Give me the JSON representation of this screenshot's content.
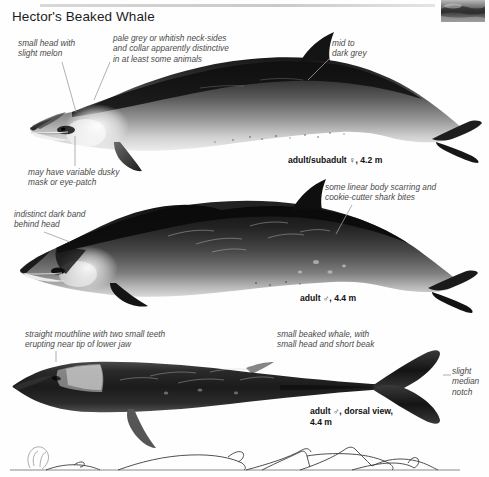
{
  "page": {
    "title": "Hector's Beaked Whale",
    "background_color": "#ffffff",
    "rule_color": "#d2d2d2"
  },
  "thumbnail": {
    "name": "beaked-whale-photo-thumbnail",
    "caption": ""
  },
  "annotations": [
    {
      "id": "small-head",
      "text": "small head with\nslight melon",
      "x": 18,
      "y": 38,
      "leader": {
        "x1": 60,
        "y1": 62,
        "x2": 75,
        "y2": 108
      }
    },
    {
      "id": "pale-grey-neck",
      "text": "pale grey or whitish neck-sides\nand collar apparently distinctive\nin at least some animals",
      "x": 113,
      "y": 33,
      "leader": {
        "x1": 108,
        "y1": 40,
        "x2": 93,
        "y2": 95
      }
    },
    {
      "id": "mid-to-dark-grey",
      "text": "mid to\ndark grey",
      "x": 332,
      "y": 38,
      "leader": {
        "x1": 330,
        "y1": 47,
        "x2": 305,
        "y2": 78
      }
    },
    {
      "id": "dusky-mask",
      "text": "may have variable dusky\nmask or eye-patch",
      "x": 28,
      "y": 167,
      "leader": {
        "x1": 74,
        "y1": 166,
        "x2": 74,
        "y2": 135
      }
    },
    {
      "id": "linear-body-scarring",
      "text": "some linear body scarring and\ncookie-cutter shark bites",
      "x": 325,
      "y": 182,
      "leader": {
        "x1": 352,
        "y1": 196,
        "x2": 337,
        "y2": 232
      }
    },
    {
      "id": "indistinct-dark-band",
      "text": "indistinct dark band\nbehind head",
      "x": 14,
      "y": 209,
      "leader": {
        "x1": 43,
        "y1": 232,
        "x2": 68,
        "y2": 240
      }
    },
    {
      "id": "straight-mouthline",
      "text": "straight mouthline with two small teeth\nerupting near tip of lower jaw",
      "x": 25,
      "y": 329,
      "leader": {
        "x1": 56,
        "y1": 312,
        "x2": 56,
        "y2": 302
      }
    },
    {
      "id": "small-beaked-whale",
      "text": "small beaked whale, with\nsmall head and short beak",
      "x": 277,
      "y": 329,
      "leader": null
    },
    {
      "id": "slight-median-notch",
      "text": "slight\nmedian\nnotch",
      "x": 452,
      "y": 366,
      "leader": null
    }
  ],
  "captions": [
    {
      "id": "adult-subadult-female",
      "text": "adult/subadult ♀, 4.2 m",
      "x": 288,
      "y": 155
    },
    {
      "id": "adult-male",
      "text": "adult ♂, 4.4 m",
      "x": 300,
      "y": 293
    },
    {
      "id": "adult-male-dorsal",
      "text": "adult ♂, dorsal view,\n4.4 m",
      "x": 310,
      "y": 406
    }
  ],
  "figures": [
    {
      "id": "figure-adult-subadult-female",
      "view": "lateral",
      "label": "adult/subadult ♀, 4.2 m"
    },
    {
      "id": "figure-adult-male",
      "view": "lateral",
      "label": "adult ♂, 4.4 m"
    },
    {
      "id": "figure-adult-male-dorsal",
      "view": "dorsal",
      "label": "adult ♂, dorsal view, 4.4 m"
    }
  ],
  "dive_sequence": {
    "id": "surfacing-dive-sequence",
    "description": "blow and surfacing profile sequence",
    "stages": 5
  }
}
